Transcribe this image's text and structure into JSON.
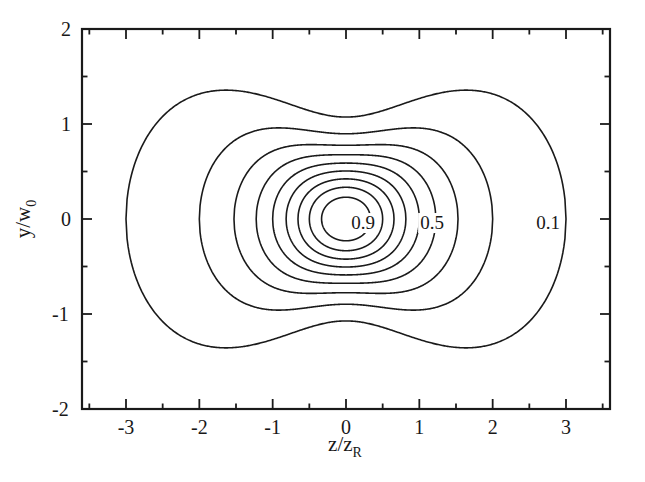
{
  "figure": {
    "background_color": "#ffffff",
    "line_color": "#1a1a1a",
    "axes_rect": {
      "left": 82,
      "top": 29,
      "right": 610,
      "bottom": 409
    }
  },
  "axes": {
    "x": {
      "label_text": "z/z",
      "label_sub": "R",
      "min": -3.6,
      "max": 3.6,
      "major_ticks": [
        -3,
        -2,
        -1,
        0,
        1,
        2,
        3
      ],
      "major_tick_labels": [
        "-3",
        "-2",
        "-1",
        "0",
        "1",
        "2",
        "3"
      ],
      "minor_ticks": [
        -3.5,
        -2.5,
        -1.5,
        -0.5,
        0.5,
        1.5,
        2.5,
        3.5
      ]
    },
    "y": {
      "label_text": "y/w",
      "label_sub": "0",
      "min": -2,
      "max": 2,
      "major_ticks": [
        -2,
        -1,
        0,
        1,
        2
      ],
      "major_tick_labels": [
        "-2",
        "-1",
        "0",
        "1",
        "2"
      ],
      "minor_ticks": [
        -1.5,
        -0.5,
        0.5,
        1.5
      ]
    }
  },
  "chart_data": {
    "type": "line",
    "subtype": "contour",
    "title": "",
    "xlabel": "z/z_R",
    "ylabel": "y/w_0",
    "xlim": [
      -3.6,
      3.6
    ],
    "ylim": [
      -2,
      2
    ],
    "grid": false,
    "legend": "none",
    "function": "I(z,y) = (1/(1+z^2)) * exp(-2*y^2/(1+z^2))",
    "levels": [
      0.1,
      0.2,
      0.3,
      0.4,
      0.5,
      0.6,
      0.7,
      0.8,
      0.9
    ],
    "level_count": 9,
    "labeled_levels": [
      {
        "value": "0.9",
        "z": 0.0,
        "y": 0.0
      },
      {
        "value": "0.5",
        "z": 0.93,
        "y": 0.0
      },
      {
        "value": "0.1",
        "z": 2.6,
        "y": 0.0
      }
    ],
    "annotations": [
      {
        "text": "0.9",
        "x_px": 363,
        "y_px": 223
      },
      {
        "text": "0.5",
        "x_px": 432,
        "y_px": 223
      },
      {
        "text": "0.1",
        "x_px": 548,
        "y_px": 223
      }
    ],
    "contour_extents": {
      "0.1": {
        "z_at_y0": 3.0,
        "y_max": 1.37,
        "y_max_at_z": 1.65,
        "y_at_z0": 1.07
      },
      "0.2": {
        "z_at_y0": 2.0,
        "y_max": 0.98,
        "y_max_at_z": 1.08,
        "y_at_z0": 0.9
      },
      "0.3": {
        "z_at_y0": 1.53,
        "y_max": 0.8,
        "y_max_at_z": 0.78,
        "y_at_z0": 0.78
      },
      "0.4": {
        "z_at_y0": 1.22,
        "y_max": 0.69,
        "y_max_at_z": 0.57,
        "y_at_z0": 0.68
      },
      "0.5": {
        "z_at_y0": 1.0,
        "y_max": 0.59,
        "y_max_at_z": 0.4,
        "y_at_z0": 0.59
      },
      "0.6": {
        "z_at_y0": 0.82,
        "y_max": 0.51,
        "y_max_at_z": 0.27,
        "y_at_z0": 0.51
      },
      "0.7": {
        "z_at_y0": 0.65,
        "y_max": 0.42,
        "y_max_at_z": 0.16,
        "y_at_z0": 0.42
      },
      "0.8": {
        "z_at_y0": 0.5,
        "y_max": 0.33,
        "y_max_at_z": 0.08,
        "y_at_z0": 0.33
      },
      "0.9": {
        "z_at_y0": 0.33,
        "y_max": 0.23,
        "y_max_at_z": 0.03,
        "y_at_z0": 0.23
      }
    }
  }
}
